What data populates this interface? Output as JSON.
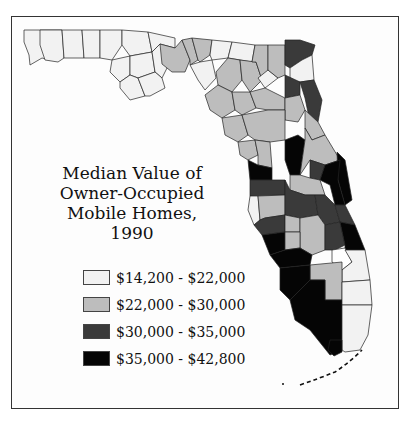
{
  "map": {
    "title_lines": [
      "Median Value of",
      "Owner-Occupied",
      "Mobile Homes,",
      "1990"
    ],
    "region": "Florida counties",
    "legend": [
      {
        "label": "$14,200 - $22,000",
        "color": "#f2f2f2",
        "class": "class-1"
      },
      {
        "label": "$22,000 - $30,000",
        "color": "#bdbdbd",
        "class": "class-2"
      },
      {
        "label": "$30,000 - $35,000",
        "color": "#3a3a3a",
        "class": "class-3"
      },
      {
        "label": "$35,000 - $42,800",
        "color": "#050505",
        "class": "class-4"
      }
    ]
  }
}
